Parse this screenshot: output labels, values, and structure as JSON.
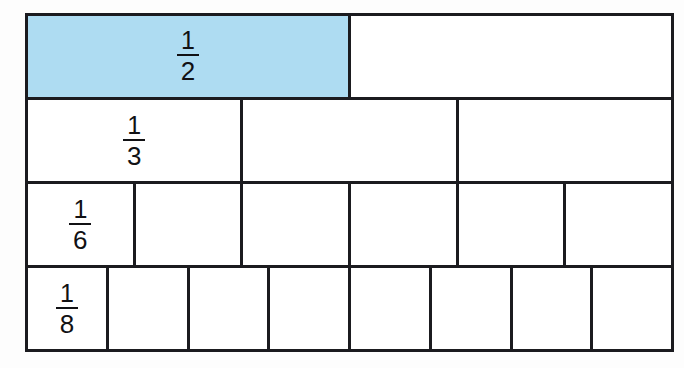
{
  "diagram": {
    "type": "fraction-wall",
    "background_color": "#fdfdfd",
    "grid_color": "#1b1b1f",
    "shade_color": "#aedcf2",
    "rows": [
      {
        "id": "row-half",
        "denominator": 2,
        "cells": 2,
        "label": {
          "numerator": "1",
          "denominator": "2"
        },
        "label_cell_index": 0,
        "shaded_cells": [
          0
        ]
      },
      {
        "id": "row-third",
        "denominator": 3,
        "cells": 3,
        "label": {
          "numerator": "1",
          "denominator": "3"
        },
        "label_cell_index": 0,
        "shaded_cells": []
      },
      {
        "id": "row-sixth",
        "denominator": 6,
        "cells": 6,
        "label": {
          "numerator": "1",
          "denominator": "6"
        },
        "label_cell_index": 0,
        "shaded_cells": []
      },
      {
        "id": "row-eighth",
        "denominator": 8,
        "cells": 8,
        "label": {
          "numerator": "1",
          "denominator": "8"
        },
        "label_cell_index": 0,
        "shaded_cells": []
      }
    ]
  }
}
